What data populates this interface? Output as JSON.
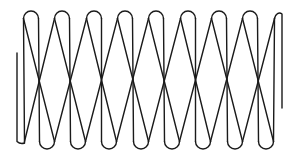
{
  "diagram": {
    "stroke_color": "#1a1a1a",
    "background_color": "#ffffff",
    "stroke_width": 1.4,
    "geometry": {
      "top_y": 11,
      "bottom_y": 149,
      "loop_radius": 7.5,
      "pitch": 31.3,
      "top_loop_centers": [
        31,
        62,
        94,
        125,
        156,
        188,
        219,
        250
      ],
      "bottom_loop_centers": [
        47,
        78,
        109,
        141,
        172,
        203,
        235,
        266
      ],
      "left_end": {
        "x": 17,
        "y_top": 53,
        "y_bottom": 145
      },
      "right_end": {
        "x": 282,
        "y_top": 12,
        "y_bottom": 108
      }
    },
    "coil_count": 8
  }
}
